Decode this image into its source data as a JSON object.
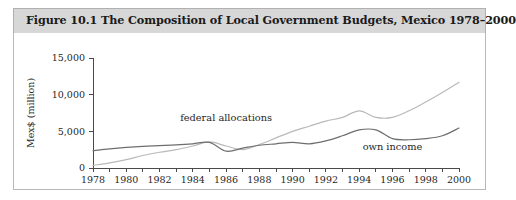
{
  "figure": {
    "title": "Figure 10.1  The Composition of Local Government Budgets, Mexico 1978–2000",
    "header_bg": "#d7d7d7",
    "border_color": "#b8b8b8"
  },
  "chart_data": {
    "type": "line",
    "title": "The Composition of Local Government Budgets, Mexico 1978–2000",
    "xlabel": "",
    "ylabel": "Mex$ (million)",
    "xlim": [
      1978,
      2000
    ],
    "ylim": [
      0,
      15000
    ],
    "grid": false,
    "legend_position": "inline-annotation",
    "ytick_labels": [
      "0",
      "5,000",
      "10,000",
      "15,000"
    ],
    "ytick_values": [
      0,
      5000,
      10000,
      15000
    ],
    "xtick_labels": [
      "1978",
      "1980",
      "1982",
      "1984",
      "1986",
      "1988",
      "1990",
      "1992",
      "1994",
      "1996",
      "1998",
      "2000"
    ],
    "xtick_values": [
      1978,
      1980,
      1982,
      1984,
      1986,
      1988,
      1990,
      1992,
      1994,
      1996,
      1998,
      2000
    ],
    "xtick_minor_values": [
      1979,
      1981,
      1983,
      1985,
      1987,
      1989,
      1991,
      1993,
      1995,
      1997,
      1999
    ],
    "x": [
      1978,
      1979,
      1980,
      1981,
      1982,
      1983,
      1984,
      1985,
      1986,
      1987,
      1988,
      1989,
      1990,
      1991,
      1992,
      1993,
      1994,
      1995,
      1996,
      1997,
      1998,
      1999,
      2000
    ],
    "series": [
      {
        "name": "federal allocations",
        "color": "#b9b9b9",
        "label_x": 1986,
        "label_y": 6400,
        "values": [
          350,
          700,
          1150,
          1700,
          2150,
          2500,
          3000,
          3550,
          3000,
          2500,
          3200,
          4100,
          5000,
          5700,
          6400,
          6900,
          7800,
          6900,
          6900,
          7800,
          9000,
          10300,
          11700
        ]
      },
      {
        "name": "own income",
        "color": "#6e6e6e",
        "label_x": 1996,
        "label_y": 2500,
        "values": [
          2350,
          2600,
          2800,
          2950,
          3050,
          3150,
          3300,
          3500,
          2300,
          2700,
          3100,
          3300,
          3500,
          3300,
          3700,
          4400,
          5200,
          5200,
          4000,
          3850,
          4000,
          4400,
          5450
        ]
      }
    ]
  }
}
